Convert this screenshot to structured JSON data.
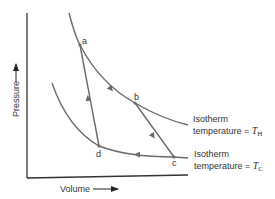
{
  "diagram": {
    "type": "Carnot cycle pressure-volume diagram",
    "axes": {
      "y_label": "Pressure",
      "x_label": "Volume"
    },
    "points": [
      {
        "id": "a",
        "label": "a"
      },
      {
        "id": "b",
        "label": "b"
      },
      {
        "id": "c",
        "label": "c"
      },
      {
        "id": "d",
        "label": "d"
      }
    ],
    "isotherms": [
      {
        "id": "hot",
        "line1": "Isotherm",
        "line2_prefix": "temperature = ",
        "symbol": "T",
        "subscript": "H"
      },
      {
        "id": "cold",
        "line1": "Isotherm",
        "line2_prefix": "temperature = ",
        "symbol": "T",
        "subscript": "C"
      }
    ],
    "path_order": [
      "a",
      "b",
      "c",
      "d",
      "a"
    ],
    "colors": {
      "curve": "#6a6a6a",
      "axis": "#333333",
      "text": "#333333"
    }
  }
}
